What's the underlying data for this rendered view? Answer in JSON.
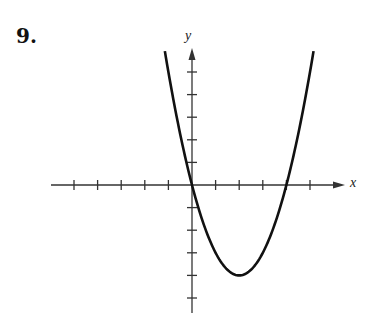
{
  "problem": {
    "number": "9."
  },
  "chart_data": {
    "type": "line",
    "title": "",
    "xlabel": "x",
    "ylabel": "y",
    "xlim": [
      -5,
      6
    ],
    "ylim": [
      -5,
      6
    ],
    "grid": false,
    "tick_spacing": 1,
    "x_ticks": [
      -5,
      -4,
      -3,
      -2,
      -1,
      1,
      2,
      3,
      4,
      5
    ],
    "y_ticks": [
      -5,
      -4,
      -3,
      -2,
      -1,
      1,
      2,
      3,
      4,
      5
    ],
    "tick_labels_shown": false,
    "series": [
      {
        "name": "parabola",
        "equation": "y = (x - 2)^2 - 4",
        "vertex": [
          2,
          -4
        ],
        "x_intercepts": [
          0,
          4
        ],
        "y_intercept": 0,
        "x": [
          -1,
          0,
          1,
          2,
          3,
          4,
          5
        ],
        "values": [
          5,
          0,
          -3,
          -4,
          -3,
          0,
          5
        ]
      }
    ],
    "colors": {
      "axis": "#333333",
      "curve": "#111111"
    }
  }
}
